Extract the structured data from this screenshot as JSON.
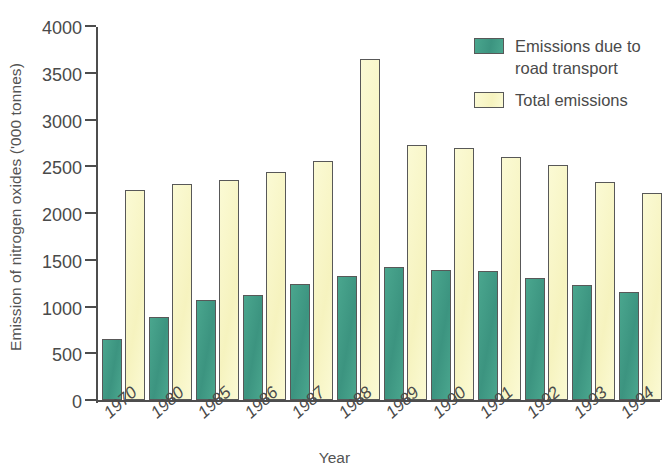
{
  "chart_data": {
    "type": "bar",
    "title": "",
    "xlabel": "Year",
    "ylabel": "Emission of nitrogen oxides ('000 tonnes)",
    "ylim": [
      0,
      4000
    ],
    "ytick_values": [
      0,
      500,
      1000,
      1500,
      2000,
      2500,
      3000,
      3500,
      4000
    ],
    "ytick_labels": [
      "0",
      "500",
      "1000",
      "1500",
      "2000",
      "2500",
      "3000",
      "3500",
      "4000"
    ],
    "grid": false,
    "legend_position": "top-right",
    "categories": [
      "1970",
      "1980",
      "1985",
      "1986",
      "1987",
      "1988",
      "1989",
      "1990",
      "1991",
      "1992",
      "1993",
      "1994"
    ],
    "series": [
      {
        "name": "Emissions due to road transport",
        "color": "#3f9b84",
        "values": [
          650,
          890,
          1065,
          1120,
          1240,
          1330,
          1425,
          1395,
          1380,
          1300,
          1225,
          1160
        ]
      },
      {
        "name": "Total emissions",
        "color": "#f8f6c8",
        "values": [
          2250,
          2315,
          2350,
          2435,
          2555,
          3650,
          2725,
          2700,
          2600,
          2510,
          2330,
          2210
        ]
      }
    ]
  },
  "legend": {
    "items": [
      {
        "label": "Emissions due to road transport",
        "swatch": "road-transport-swatch"
      },
      {
        "label": "Total emissions",
        "swatch": "total-emissions-swatch"
      }
    ]
  }
}
